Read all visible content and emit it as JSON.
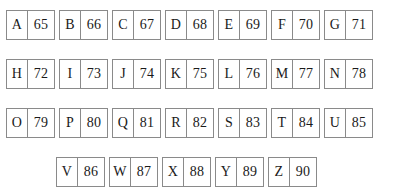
{
  "page": {
    "background_color": "#ffffff",
    "border_color": "#8a8a8a",
    "text_color": "#1a1a1a"
  },
  "table": {
    "type": "ascii-letter-code-grid",
    "rows": [
      {
        "offset": false,
        "cells": [
          {
            "letter": "A",
            "code": "65"
          },
          {
            "letter": "B",
            "code": "66"
          },
          {
            "letter": "C",
            "code": "67"
          },
          {
            "letter": "D",
            "code": "68"
          },
          {
            "letter": "E",
            "code": "69"
          },
          {
            "letter": "F",
            "code": "70"
          },
          {
            "letter": "G",
            "code": "71"
          }
        ]
      },
      {
        "offset": false,
        "cells": [
          {
            "letter": "H",
            "code": "72"
          },
          {
            "letter": "I",
            "code": "73"
          },
          {
            "letter": "J",
            "code": "74"
          },
          {
            "letter": "K",
            "code": "75"
          },
          {
            "letter": "L",
            "code": "76"
          },
          {
            "letter": "M",
            "code": "77"
          },
          {
            "letter": "N",
            "code": "78"
          }
        ]
      },
      {
        "offset": false,
        "cells": [
          {
            "letter": "O",
            "code": "79"
          },
          {
            "letter": "P",
            "code": "80"
          },
          {
            "letter": "Q",
            "code": "81"
          },
          {
            "letter": "R",
            "code": "82"
          },
          {
            "letter": "S",
            "code": "83"
          },
          {
            "letter": "T",
            "code": "84"
          },
          {
            "letter": "U",
            "code": "85"
          }
        ]
      },
      {
        "offset": true,
        "cells": [
          {
            "letter": "V",
            "code": "86"
          },
          {
            "letter": "W",
            "code": "87"
          },
          {
            "letter": "X",
            "code": "88"
          },
          {
            "letter": "Y",
            "code": "89"
          },
          {
            "letter": "Z",
            "code": "90"
          }
        ]
      }
    ]
  }
}
